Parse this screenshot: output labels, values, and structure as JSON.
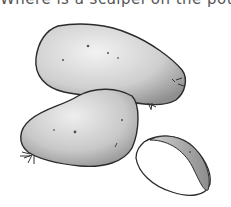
{
  "caption": {
    "text": "Where is a scalpel on the potato?",
    "clipped": true
  },
  "illustration": {
    "subject": "pencil drawing of potatoes",
    "items": [
      {
        "name": "large-potato",
        "description": "large whole potato, top"
      },
      {
        "name": "medium-potato",
        "description": "whole potato, lower left"
      },
      {
        "name": "cut-potato-half",
        "description": "cut potato piece, lower right"
      }
    ],
    "colors": {
      "outline": "#2b2b2b",
      "shade": "#9a9a9a",
      "light": "#e6e6e6",
      "background": "#ffffff"
    }
  }
}
